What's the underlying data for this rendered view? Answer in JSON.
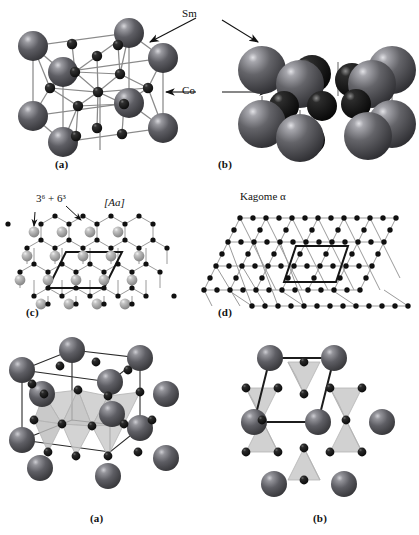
{
  "figure": {
    "title_panels": [
      "(a)",
      "(b)",
      "(c)",
      "(d)",
      "(a)",
      "(b)"
    ],
    "atom_labels": {
      "sm": "Sm",
      "co": "Co"
    },
    "net_labels": {
      "vertex_notation": "3⁶ + 6³",
      "stacking": "[Aa]",
      "kagome": "Kagome α"
    },
    "captions": {
      "row1_a": "(a)",
      "row1_b": "(b)",
      "row2_c": "(c)",
      "row2_d": "(d)",
      "row3_a": "(a)",
      "row3_b": "(b)"
    },
    "colors": {
      "sm_sphere": "#55555a",
      "sm_sphere_light": "#8d8d92",
      "co_sphere": "#141414",
      "bond": "#8a8a8a",
      "cell_edge": "#1c1c1c",
      "tetrahedron": "#c9c9c9",
      "net_line": "#9a9a9a",
      "background": "#ffffff"
    },
    "structure": {
      "compound": "SmCo5",
      "sm_atom": "Sm",
      "co_atom": "Co"
    }
  }
}
